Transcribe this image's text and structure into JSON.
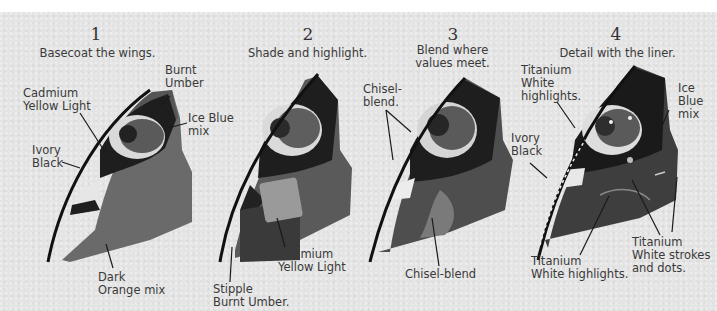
{
  "steps": [
    {
      "number": "1",
      "title": "Basecoat the wings.",
      "labels": {
        "burnt_umber": "Burnt\nUmber",
        "cadmium_yellow_light": "Cadmium\nYellow Light",
        "ice_blue_mix": "Ice Blue\nmix",
        "ivory_black": "Ivory\nBlack",
        "dark_orange_mix": "Dark\nOrange mix"
      }
    },
    {
      "number": "2",
      "title": "Shade and highlight.",
      "labels": {
        "cadmium_yellow_light": "Cadmium\nYellow Light",
        "stipple_burnt_umber": "Stipple\nBurnt Umber."
      }
    },
    {
      "number": "3",
      "title": "Blend where\nvalues meet.",
      "labels": {
        "chisel_blend_top": "Chisel-\nblend.",
        "chisel_blend_bottom": "Chisel-blend"
      }
    },
    {
      "number": "4",
      "title": "Detail with the liner.",
      "labels": {
        "titanium_white_highlights_top": "Titanium\nWhite\nhighlights.",
        "ice_blue_mix": "Ice\nBlue\nmix",
        "ivory_black": "Ivory\nBlack",
        "titanium_white_highlights_bottom": "Titanium\nWhite highlights.",
        "titanium_white_strokes": "Titanium\nWhite strokes\nand dots."
      }
    }
  ],
  "colors": {
    "paper": "#e4e4e4",
    "text": "#3a3a3a",
    "black_paint": "#1a1a1a",
    "dark_wing": "#4a4a4a",
    "mid_wing": "#666666",
    "light_band": "#d8d8d8"
  }
}
